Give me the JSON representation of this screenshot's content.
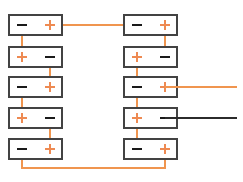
{
  "diagram": {
    "colors": {
      "wire_positive": "#f0954f",
      "wire_negative": "#2b2b2b",
      "terminal_plus": "#ee8a52",
      "terminal_minus": "#1a1a1a",
      "battery_outline": "#434343",
      "background": "#ffffff"
    },
    "canvas": {
      "width": 243,
      "height": 182
    },
    "battery_geometry": {
      "width": 53,
      "height": 20,
      "left_column_x": 9,
      "right_column_x": 124,
      "row_y": [
        15,
        47,
        77,
        108,
        139
      ],
      "left_terminal_offset": 13,
      "right_terminal_offset": 41,
      "terminal_mark_halfwidth": 5,
      "plus_mark_halfheight": 5
    },
    "batteries": [
      {
        "id": "L1",
        "column": "left",
        "row": 1,
        "x": 9,
        "y": 15,
        "left_terminal": "minus",
        "right_terminal": "plus"
      },
      {
        "id": "L2",
        "column": "left",
        "row": 2,
        "x": 9,
        "y": 47,
        "left_terminal": "plus",
        "right_terminal": "minus"
      },
      {
        "id": "L3",
        "column": "left",
        "row": 3,
        "x": 9,
        "y": 77,
        "left_terminal": "minus",
        "right_terminal": "plus"
      },
      {
        "id": "L4",
        "column": "left",
        "row": 4,
        "x": 9,
        "y": 108,
        "left_terminal": "plus",
        "right_terminal": "minus"
      },
      {
        "id": "L5",
        "column": "left",
        "row": 5,
        "x": 9,
        "y": 139,
        "left_terminal": "minus",
        "right_terminal": "plus"
      },
      {
        "id": "R1",
        "column": "right",
        "row": 1,
        "x": 124,
        "y": 15,
        "left_terminal": "minus",
        "right_terminal": "plus"
      },
      {
        "id": "R2",
        "column": "right",
        "row": 2,
        "x": 124,
        "y": 47,
        "left_terminal": "plus",
        "right_terminal": "minus"
      },
      {
        "id": "R3",
        "column": "right",
        "row": 3,
        "x": 124,
        "y": 77,
        "left_terminal": "minus",
        "right_terminal": "plus"
      },
      {
        "id": "R4",
        "column": "right",
        "row": 4,
        "x": 124,
        "y": 108,
        "left_terminal": "plus",
        "right_terminal": "minus"
      },
      {
        "id": "R5",
        "column": "right",
        "row": 5,
        "x": 124,
        "y": 139,
        "left_terminal": "minus",
        "right_terminal": "plus"
      }
    ],
    "connections": [
      {
        "id": "C1",
        "name": "left-1-minus-to-left-2-plus",
        "color": "positive",
        "path": "M 22 25 L 22 57"
      },
      {
        "id": "C2",
        "name": "left-2-minus-to-left-3-plus",
        "color": "positive",
        "path": "M 50 57 L 50 87"
      },
      {
        "id": "C3",
        "name": "left-3-minus-to-left-4-plus",
        "color": "positive",
        "path": "M 22 87 L 22 118"
      },
      {
        "id": "C4",
        "name": "left-4-minus-to-left-5-plus",
        "color": "positive",
        "path": "M 50 118 L 50 149"
      },
      {
        "id": "C5",
        "name": "right-1-plus-to-right-2-minus",
        "color": "positive",
        "path": "M 165 25 L 165 57"
      },
      {
        "id": "C6",
        "name": "right-2-plus-to-right-3-minus",
        "color": "positive",
        "path": "M 137 57 L 137 87"
      },
      {
        "id": "C7",
        "name": "right-3-minus-to-right-4-plus",
        "color": "positive",
        "path": "M 137 87 L 137 118"
      },
      {
        "id": "C8",
        "name": "right-4-plus-to-right-5-minus",
        "color": "positive",
        "path": "M 137 118 L 137 149"
      },
      {
        "id": "C9",
        "name": "top-crossover-left-plus-to-right-minus",
        "color": "positive",
        "path": "M 50 25 L 137 25"
      },
      {
        "id": "C10",
        "name": "bottom-crossover-left-minus-to-right-plus",
        "color": "positive",
        "path": "M 22 149 L 22 168 L 165 168 L 165 149"
      }
    ],
    "output_leads": [
      {
        "id": "OUT+",
        "name": "positive-output-lead",
        "color": "positive",
        "path": "M 165 87 L 237 87",
        "polarity": "+"
      },
      {
        "id": "OUT-",
        "name": "negative-output-lead",
        "color": "negative",
        "path": "M 165 118 L 237 118",
        "polarity": "-"
      }
    ]
  }
}
